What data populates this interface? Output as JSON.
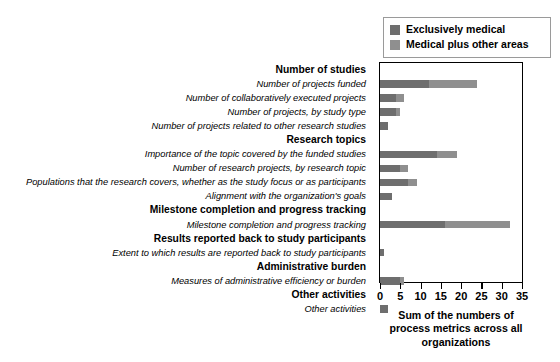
{
  "chart_data": {
    "type": "bar",
    "orientation": "horizontal",
    "stacked": true,
    "title": "",
    "xlabel": "Sum of the numbers of process metrics across all organizations",
    "ylabel": "",
    "xlim": [
      0,
      35
    ],
    "xticks": [
      0,
      5,
      10,
      15,
      20,
      25,
      30,
      35
    ],
    "xticklabels": [
      "0",
      "5",
      "10",
      "15",
      "20",
      "25",
      "30",
      "35"
    ],
    "grid": false,
    "legend_position": "top-right",
    "series": [
      {
        "name": "Exclusively medical",
        "color": "#6e6e6e",
        "values": [
          null,
          12,
          4,
          4,
          2,
          null,
          14,
          5,
          7,
          3,
          null,
          16,
          null,
          1,
          null,
          5,
          null,
          2
        ]
      },
      {
        "name": "Medical plus other areas",
        "color": "#8f8f8f",
        "values": [
          null,
          12,
          2,
          1,
          0,
          null,
          5,
          2,
          2,
          0,
          null,
          16,
          null,
          0,
          null,
          1,
          null,
          0
        ]
      }
    ],
    "categories": [
      "Number of studies",
      "Number of projects funded",
      "Number of collaboratively executed projects",
      "Number of projects, by study type",
      "Number of projects related to other research studies",
      "Research topics",
      "Importance of the topic covered by the funded studies",
      "Number of research projects, by research topic",
      "Populations that the research covers, whether as the study focus or as participants",
      "Alignment with the organization's goals",
      "Milestone completion and progress tracking",
      "Milestone completion and progress tracking",
      "Results reported back to study participants",
      "Extent to which results are reported back to study participants",
      "Administrative burden",
      "Measures of administrative efficiency or burden",
      "Other activities",
      "Other activities"
    ],
    "totals": [
      null,
      24,
      6,
      5,
      2,
      null,
      19,
      7,
      9,
      3,
      null,
      32,
      null,
      1,
      null,
      6,
      null,
      2
    ]
  },
  "rows": [
    {
      "label": "Number of studies",
      "kind": "group",
      "a": null,
      "b": null
    },
    {
      "label": "Number of projects funded",
      "kind": "item",
      "a": 12,
      "b": 12
    },
    {
      "label": "Number of collaboratively executed projects",
      "kind": "item",
      "a": 4,
      "b": 2
    },
    {
      "label": "Number of projects, by study type",
      "kind": "item",
      "a": 4,
      "b": 1
    },
    {
      "label": "Number of projects related to other research studies",
      "kind": "item",
      "a": 2,
      "b": 0
    },
    {
      "label": "Research topics",
      "kind": "group",
      "a": null,
      "b": null
    },
    {
      "label": "Importance of the topic covered by the funded studies",
      "kind": "item",
      "a": 14,
      "b": 5
    },
    {
      "label": "Number of research projects, by research topic",
      "kind": "item",
      "a": 5,
      "b": 2
    },
    {
      "label": "Populations that the research covers, whether as the study focus or as participants",
      "kind": "item",
      "a": 7,
      "b": 2
    },
    {
      "label": "Alignment with the organization's goals",
      "kind": "item",
      "a": 3,
      "b": 0
    },
    {
      "label": "Milestone completion and progress tracking",
      "kind": "group",
      "a": null,
      "b": null
    },
    {
      "label": "Milestone completion and progress tracking",
      "kind": "item",
      "a": 16,
      "b": 16
    },
    {
      "label": "Results reported back to study participants",
      "kind": "group",
      "a": null,
      "b": null
    },
    {
      "label": "Extent to which results are reported back to study participants",
      "kind": "item",
      "a": 1,
      "b": 0
    },
    {
      "label": "Administrative burden",
      "kind": "group",
      "a": null,
      "b": null
    },
    {
      "label": "Measures of administrative efficiency or burden",
      "kind": "item",
      "a": 5,
      "b": 1
    },
    {
      "label": "Other activities",
      "kind": "group",
      "a": null,
      "b": null
    },
    {
      "label": "Other activities",
      "kind": "item",
      "a": 2,
      "b": 0
    }
  ],
  "legend": {
    "items": [
      {
        "label": "Exclusively medical",
        "color": "#6e6e6e"
      },
      {
        "label": "Medical plus other areas",
        "color": "#8f8f8f"
      }
    ]
  },
  "axis": {
    "title_line1": "Sum of the numbers of",
    "title_line2": "process metrics across all",
    "title_line3": "organizations",
    "title_full": "Sum of the numbers of process metrics across all organizations"
  }
}
